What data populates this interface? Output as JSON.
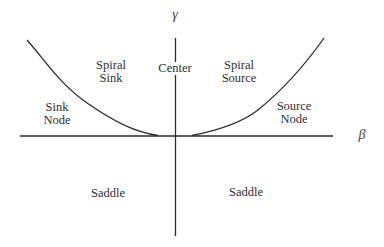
{
  "diagram": {
    "type": "bifurcation-regions",
    "axes": {
      "horizontal_label": "β",
      "vertical_label": "γ"
    },
    "regions": [
      {
        "id": "spiral-sink",
        "lines": [
          "Spiral",
          "Sink"
        ]
      },
      {
        "id": "center",
        "lines": [
          "Center"
        ]
      },
      {
        "id": "spiral-source",
        "lines": [
          "Spiral",
          "Source"
        ]
      },
      {
        "id": "sink-node",
        "lines": [
          "Sink",
          "Node"
        ]
      },
      {
        "id": "source-node",
        "lines": [
          "Source",
          "Node"
        ]
      },
      {
        "id": "saddle-left",
        "lines": [
          "Saddle"
        ]
      },
      {
        "id": "saddle-right",
        "lines": [
          "Saddle"
        ]
      }
    ],
    "colors": {
      "line": "#2a2a2a",
      "background": "#ffffff"
    }
  }
}
